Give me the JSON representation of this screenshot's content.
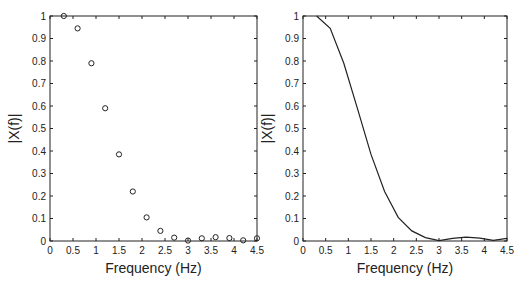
{
  "chart_data": [
    {
      "type": "scatter",
      "marker": "open-circle",
      "title": "",
      "xlabel": "Frequency (Hz)",
      "ylabel": "|X(f)|",
      "xlim": [
        0,
        4.5
      ],
      "ylim": [
        0,
        1
      ],
      "xticks": [
        0,
        0.5,
        1,
        1.5,
        2,
        2.5,
        3,
        3.5,
        4,
        4.5
      ],
      "xtick_labels": [
        "0",
        "0.5",
        "1",
        "1.5",
        "2",
        "2.5",
        "3",
        "3.5",
        "4",
        "4.5"
      ],
      "yticks": [
        0,
        0.1,
        0.2,
        0.3,
        0.4,
        0.5,
        0.6,
        0.7,
        0.8,
        0.9,
        1
      ],
      "ytick_labels": [
        "0",
        "0.1",
        "0.2",
        "0.3",
        "0.4",
        "0.5",
        "0.6",
        "0.7",
        "0.8",
        "0.9",
        "1"
      ],
      "grid": false,
      "x": [
        0.3,
        0.6,
        0.9,
        1.2,
        1.5,
        1.8,
        2.1,
        2.4,
        2.7,
        3.0,
        3.3,
        3.6,
        3.9,
        4.2,
        4.5
      ],
      "y": [
        1.0,
        0.945,
        0.79,
        0.59,
        0.385,
        0.22,
        0.105,
        0.045,
        0.015,
        0.002,
        0.012,
        0.017,
        0.013,
        0.003,
        0.012
      ]
    },
    {
      "type": "line",
      "title": "",
      "xlabel": "Frequency (Hz)",
      "ylabel": "|X(f)|",
      "xlim": [
        0,
        4.5
      ],
      "ylim": [
        0,
        1
      ],
      "xticks": [
        0,
        0.5,
        1,
        1.5,
        2,
        2.5,
        3,
        3.5,
        4,
        4.5
      ],
      "xtick_labels": [
        "0",
        "0.5",
        "1",
        "1.5",
        "2",
        "2.5",
        "3",
        "3.5",
        "4",
        "4.5"
      ],
      "yticks": [
        0,
        0.1,
        0.2,
        0.3,
        0.4,
        0.5,
        0.6,
        0.7,
        0.8,
        0.9,
        1
      ],
      "ytick_labels": [
        "0",
        "0.1",
        "0.2",
        "0.3",
        "0.4",
        "0.5",
        "0.6",
        "0.7",
        "0.8",
        "0.9",
        "1"
      ],
      "grid": false,
      "x": [
        0.3,
        0.6,
        0.9,
        1.2,
        1.5,
        1.8,
        2.1,
        2.4,
        2.7,
        3.0,
        3.3,
        3.6,
        3.9,
        4.2,
        4.5
      ],
      "y": [
        1.0,
        0.945,
        0.79,
        0.59,
        0.385,
        0.22,
        0.105,
        0.045,
        0.015,
        0.002,
        0.012,
        0.017,
        0.013,
        0.003,
        0.012
      ]
    }
  ]
}
